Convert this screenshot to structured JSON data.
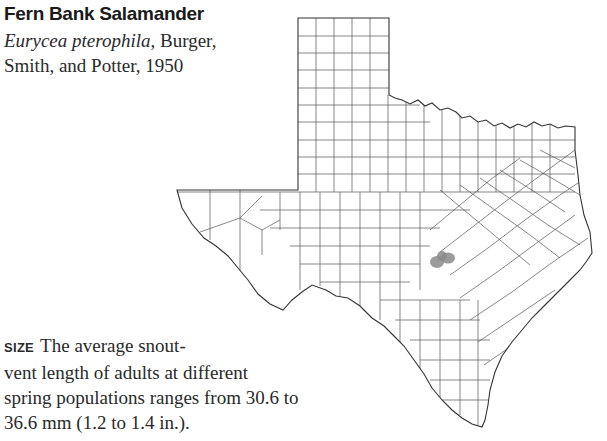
{
  "species": {
    "common_name": "Fern Bank Salamander",
    "scientific_name": "Eurycea pterophila",
    "authority_line1": ", Burger,",
    "authority_line2": "Smith, and Potter, 1950"
  },
  "size_section": {
    "label": "SIZE",
    "line1": "The average snout-",
    "line2": "vent length of adults at different",
    "line3": "spring populations ranges from 30.6 to",
    "line4": "36.6 mm (1.2 to 1.4 in.)."
  },
  "map": {
    "region": "Texas",
    "subdivisions": "counties",
    "range_color": "#8a8a8a",
    "outline_color": "#333333",
    "range_label": "range-area"
  }
}
